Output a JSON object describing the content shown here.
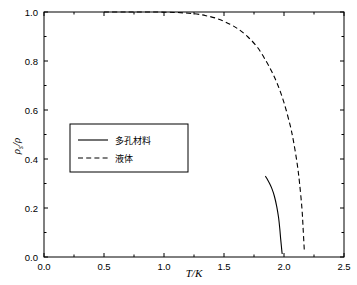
{
  "chart_data": {
    "type": "line",
    "title": "",
    "xlabel": "T/K",
    "ylabel": "ρs/ρ",
    "xlim": [
      0.0,
      2.5
    ],
    "ylim": [
      0.0,
      1.0
    ],
    "xticks": [
      "0.0",
      "0.5",
      "1.0",
      "1.5",
      "2.0",
      "2.5"
    ],
    "yticks": [
      "0.0",
      "0.2",
      "0.4",
      "0.6",
      "0.8",
      "1.0"
    ],
    "grid": false,
    "legend_position": "center-left",
    "series": [
      {
        "name": "多孔材料",
        "style": "solid",
        "color": "#000000",
        "x": [
          1.845,
          1.86,
          1.88,
          1.9,
          1.92,
          1.94,
          1.955,
          1.965,
          1.972,
          1.978,
          1.982,
          1.985
        ],
        "y": [
          0.33,
          0.318,
          0.3,
          0.278,
          0.248,
          0.205,
          0.16,
          0.115,
          0.075,
          0.045,
          0.025,
          0.012
        ]
      },
      {
        "name": "液体",
        "style": "dashed",
        "color": "#000000",
        "x": [
          0.5,
          0.7,
          0.9,
          1.1,
          1.25,
          1.35,
          1.45,
          1.55,
          1.62,
          1.7,
          1.78,
          1.85,
          1.9,
          1.95,
          2.0,
          2.05,
          2.08,
          2.11,
          2.13,
          2.15,
          2.16,
          2.17
        ],
        "y": [
          1.0,
          1.0,
          1.0,
          0.998,
          0.993,
          0.985,
          0.972,
          0.95,
          0.93,
          0.898,
          0.855,
          0.8,
          0.755,
          0.7,
          0.63,
          0.54,
          0.47,
          0.38,
          0.3,
          0.195,
          0.11,
          0.02
        ]
      }
    ]
  },
  "axes": {
    "x_title": "T/K",
    "y_title_main": "ρ",
    "y_title_sub": "s",
    "y_title_den": "/ρ"
  },
  "legend": {
    "items": [
      {
        "label": "多孔材料",
        "style": "solid"
      },
      {
        "label": "液体",
        "style": "dashed"
      }
    ]
  },
  "colors": {
    "axis": "#000000",
    "background": "#ffffff",
    "line": "#000000"
  }
}
